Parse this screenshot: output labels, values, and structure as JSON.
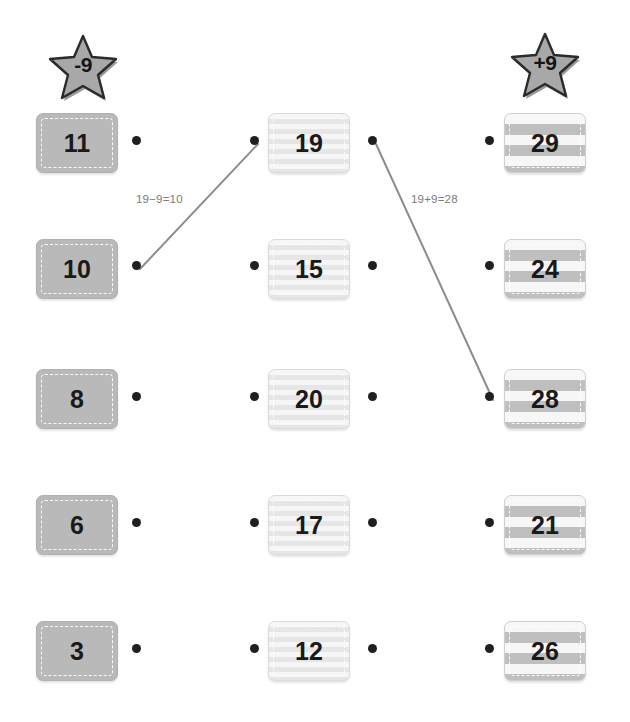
{
  "page": {
    "background": "#ffffff",
    "width": 630,
    "height": 722
  },
  "badges": [
    {
      "name": "minus-nine-star",
      "label": "-9",
      "x": 46,
      "y": 32,
      "color": "#a8a8a8"
    },
    {
      "name": "plus-nine-star",
      "label": "+9",
      "x": 508,
      "y": 30,
      "color": "#a8a8a8"
    }
  ],
  "columns": [
    {
      "id": "left",
      "style": "v-solid",
      "x": 36,
      "dot_side": "right"
    },
    {
      "id": "middle",
      "style": "v-soft",
      "x": 268,
      "dot_side": "both"
    },
    {
      "id": "right",
      "style": "v-bold",
      "x": 504,
      "dot_side": "left"
    }
  ],
  "rows_y": [
    113,
    239,
    369,
    495,
    621
  ],
  "cards": {
    "left": [
      "11",
      "10",
      "8",
      "6",
      "3"
    ],
    "middle": [
      "19",
      "15",
      "20",
      "17",
      "12"
    ],
    "right": [
      "29",
      "24",
      "28",
      "21",
      "26"
    ]
  },
  "dots": [
    {
      "name": "dot-left-11",
      "x": 136,
      "y": 140
    },
    {
      "name": "dot-left-10",
      "x": 136,
      "y": 265
    },
    {
      "name": "dot-left-8",
      "x": 136,
      "y": 396
    },
    {
      "name": "dot-left-6",
      "x": 136,
      "y": 522
    },
    {
      "name": "dot-left-3",
      "x": 136,
      "y": 648
    },
    {
      "name": "dot-mid-19-l",
      "x": 254,
      "y": 140
    },
    {
      "name": "dot-mid-15-l",
      "x": 254,
      "y": 265
    },
    {
      "name": "dot-mid-20-l",
      "x": 254,
      "y": 396
    },
    {
      "name": "dot-mid-17-l",
      "x": 254,
      "y": 522
    },
    {
      "name": "dot-mid-12-l",
      "x": 254,
      "y": 648
    },
    {
      "name": "dot-mid-19-r",
      "x": 372,
      "y": 140
    },
    {
      "name": "dot-mid-15-r",
      "x": 372,
      "y": 265
    },
    {
      "name": "dot-mid-20-r",
      "x": 372,
      "y": 396
    },
    {
      "name": "dot-mid-17-r",
      "x": 372,
      "y": 522
    },
    {
      "name": "dot-mid-12-r",
      "x": 372,
      "y": 648
    },
    {
      "name": "dot-right-29",
      "x": 489,
      "y": 140
    },
    {
      "name": "dot-right-24",
      "x": 489,
      "y": 265
    },
    {
      "name": "dot-right-28",
      "x": 489,
      "y": 396
    },
    {
      "name": "dot-right-21",
      "x": 489,
      "y": 522
    },
    {
      "name": "dot-right-26",
      "x": 489,
      "y": 648
    }
  ],
  "connections": [
    {
      "name": "connection-19-to-10",
      "from_x": 140,
      "from_y": 269,
      "to_x": 258,
      "to_y": 144,
      "color": "#8c8c8c",
      "label": "19−9=10",
      "label_x": 136,
      "label_y": 193
    },
    {
      "name": "connection-19-to-28",
      "from_x": 376,
      "from_y": 144,
      "to_x": 493,
      "to_y": 400,
      "color": "#8c8c8c",
      "label": "19+9=28",
      "label_x": 411,
      "label_y": 193
    }
  ]
}
